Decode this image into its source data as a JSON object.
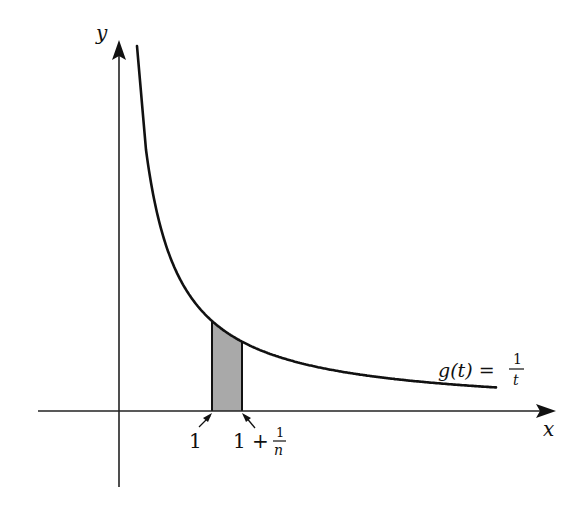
{
  "diagram": {
    "type": "function-plot",
    "axes": {
      "x_label": "x",
      "y_label": "y"
    },
    "function": {
      "name": "g(t)",
      "expression": "1/t",
      "label_lhs": "g(t) =",
      "label_num": "1",
      "label_den": "t"
    },
    "shaded_region": {
      "from": "1",
      "to": "1 + 1/n",
      "left_label": "1",
      "right_label_prefix": "1 +",
      "right_label_num": "1",
      "right_label_den": "n",
      "fill_color": "#a9a9a9"
    },
    "colors": {
      "curve": "#111111",
      "axes": "#222222",
      "background": "#ffffff"
    }
  }
}
